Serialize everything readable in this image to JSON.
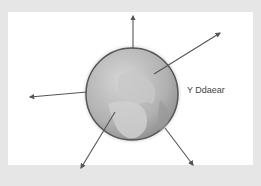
{
  "diagram": {
    "label": "Y Ddaear",
    "caption": "",
    "globe": {
      "cx": 132,
      "cy": 94,
      "r": 46,
      "fill": "#b8b8b8",
      "stroke": "#555555"
    },
    "arrows": [
      {
        "name": "arrow-up",
        "x1": 133,
        "y1": 49,
        "x2": 133,
        "y2": 16
      },
      {
        "name": "arrow-up-right",
        "x1": 154,
        "y1": 74,
        "x2": 220,
        "y2": 33
      },
      {
        "name": "arrow-left",
        "x1": 87,
        "y1": 92,
        "x2": 30,
        "y2": 97
      },
      {
        "name": "arrow-down-left",
        "x1": 115,
        "y1": 112,
        "x2": 81,
        "y2": 168
      },
      {
        "name": "arrow-down-right",
        "x1": 165,
        "y1": 128,
        "x2": 193,
        "y2": 165
      }
    ]
  }
}
